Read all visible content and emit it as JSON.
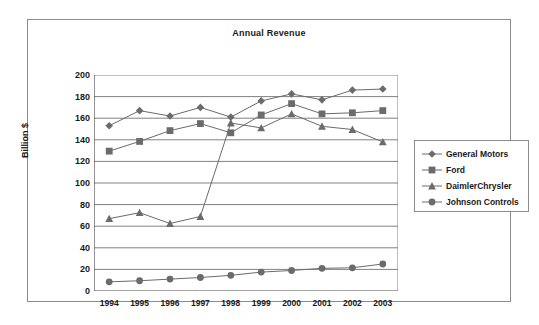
{
  "chart_data": {
    "type": "line",
    "title": "Annual Revenue",
    "xlabel": "",
    "ylabel": "Billion $",
    "categories": [
      "1994",
      "1995",
      "1996",
      "1997",
      "1998",
      "1999",
      "2000",
      "2001",
      "2002",
      "2003"
    ],
    "ylim": [
      0,
      200
    ],
    "ytick_step": 20,
    "yticks": [
      "200",
      "180",
      "160",
      "140",
      "120",
      "100",
      "80",
      "60",
      "40",
      "20",
      "0"
    ],
    "grid": "horizontal",
    "legend_position": "right",
    "series": [
      {
        "name": "General Motors",
        "marker": "diamond",
        "color": "#6b6b6b",
        "values": [
          153,
          167,
          162,
          170,
          161,
          176,
          182.5,
          177,
          186,
          187
        ]
      },
      {
        "name": "Ford",
        "marker": "square",
        "color": "#6b6b6b",
        "values": [
          129.5,
          138.5,
          148.5,
          155,
          146.5,
          163,
          173.5,
          164,
          165,
          167
        ]
      },
      {
        "name": "DaimlerChrysler",
        "marker": "triangle",
        "color": "#6b6b6b",
        "values": [
          67,
          72.5,
          62.5,
          69,
          155.5,
          151,
          164,
          152.5,
          149.5,
          138
        ]
      },
      {
        "name": "Johnson Controls",
        "marker": "circle",
        "color": "#6b6b6b",
        "values": [
          8.5,
          9.5,
          11,
          12.5,
          14.5,
          17.5,
          19,
          21,
          21.5,
          25
        ]
      }
    ]
  },
  "figure": {
    "frame_color": "#8b8b8b",
    "grid_color": "#808080",
    "axis_color": "#4d4d4d",
    "text_color": "#1a1a1a"
  }
}
